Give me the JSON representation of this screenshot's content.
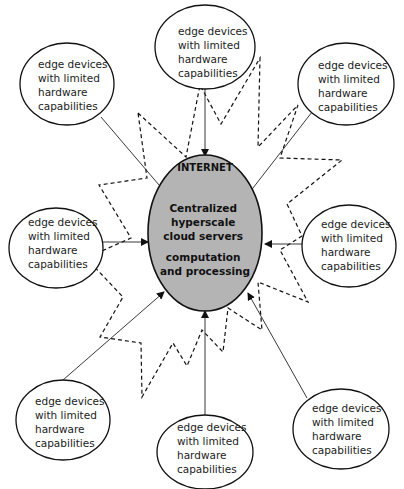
{
  "diagram": {
    "internet_label": "INTERNET",
    "center": {
      "lines": [
        "Centralized",
        "hyperscale",
        "cloud servers",
        "computation",
        "and processing"
      ],
      "fill": "#b4b4b4"
    },
    "edge_nodes": [
      {
        "id": "top",
        "lines": [
          "edge devices",
          "with limited",
          "hardware",
          "capabilities"
        ]
      },
      {
        "id": "top-left",
        "lines": [
          "edge devices",
          "with limited",
          "hardware",
          "capabilities"
        ]
      },
      {
        "id": "top-right",
        "lines": [
          "edge devices",
          "with limited",
          "hardware",
          "capabilities"
        ]
      },
      {
        "id": "left",
        "lines": [
          "edge devices",
          "with limited",
          "hardware",
          "capabilities"
        ]
      },
      {
        "id": "right",
        "lines": [
          "edge devices",
          "with limited",
          "hardware",
          "capabilities"
        ]
      },
      {
        "id": "bottom-left",
        "lines": [
          "edge devices",
          "with limited",
          "hardware",
          "capabilities"
        ]
      },
      {
        "id": "bottom",
        "lines": [
          "edge devices",
          "with limited",
          "hardware",
          "capabilities"
        ]
      },
      {
        "id": "bottom-right",
        "lines": [
          "edge devices",
          "with limited",
          "hardware",
          "capabilities"
        ]
      }
    ]
  }
}
